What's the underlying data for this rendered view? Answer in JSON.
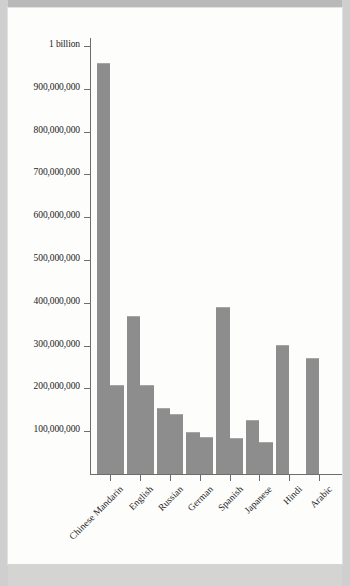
{
  "chart_data": {
    "type": "bar",
    "title": "",
    "subtitle": "",
    "xlabel": "",
    "ylabel": "",
    "grid": false,
    "legend": "none",
    "orientation": "vertical",
    "grouped": true,
    "categories": [
      "Chinese Mandarin",
      "English",
      "Russian",
      "German",
      "Spanish",
      "Japanese",
      "Hindi",
      "Arabic"
    ],
    "series": [
      {
        "name": "bar-a",
        "values": [
          960000000,
          370000000,
          155000000,
          97000000,
          390000000,
          126000000,
          302000000,
          270000000
        ]
      },
      {
        "name": "bar-b",
        "values": [
          209000000,
          207000000,
          141000000,
          86000000,
          83000000,
          74000000,
          null,
          null
        ]
      }
    ],
    "ylim": [
      0,
      1000000000
    ],
    "yticks": [
      1000000000,
      900000000,
      800000000,
      700000000,
      600000000,
      500000000,
      400000000,
      300000000,
      200000000,
      100000000
    ],
    "ytick_labels": [
      "1 billion",
      "900,000,000",
      "800,000,000",
      "700,000,000",
      "600,000,000",
      "500,000,000",
      "400,000,000",
      "300,000,000",
      "200,000,000",
      "100,000,000"
    ],
    "colors": {
      "bar": "#8d8d8d",
      "bar_highlight": "#a6a6a6",
      "axis": "#6e6e6e",
      "text": "#1b1b1b",
      "page": "#fdfdfb",
      "background": "#cfcfcf"
    }
  },
  "axis": {
    "y": {
      "ticks": [
        {
          "label": "1 billion",
          "value": 1000000000
        },
        {
          "label": "900,000,000",
          "value": 900000000
        },
        {
          "label": "800,000,000",
          "value": 800000000
        },
        {
          "label": "700,000,000",
          "value": 700000000
        },
        {
          "label": "600,000,000",
          "value": 600000000
        },
        {
          "label": "500,000,000",
          "value": 500000000
        },
        {
          "label": "400,000,000",
          "value": 400000000
        },
        {
          "label": "300,000,000",
          "value": 300000000
        },
        {
          "label": "200,000,000",
          "value": 200000000
        },
        {
          "label": "100,000,000",
          "value": 100000000
        }
      ]
    },
    "x": {
      "labels": [
        "Chinese Mandarin",
        "English",
        "Russian",
        "German",
        "Spanish",
        "Japanese",
        "Hindi",
        "Arabic"
      ]
    }
  }
}
